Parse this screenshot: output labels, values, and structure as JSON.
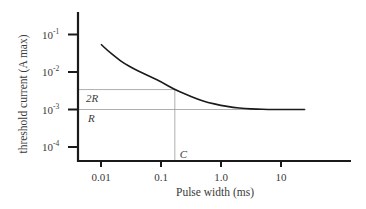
{
  "chart_data": {
    "type": "line",
    "title": "",
    "xlabel": "Pulse width (ms)",
    "ylabel": "threshold current  (A max)",
    "x_scale": "log",
    "y_scale": "log",
    "x_ticks": [
      {
        "value": 0.01,
        "label": "0.01"
      },
      {
        "value": 0.1,
        "label": "0.1"
      },
      {
        "value": 1.0,
        "label": "1.0"
      },
      {
        "value": 10,
        "label": "10"
      }
    ],
    "y_ticks": [
      {
        "value": 0.1,
        "label_base": "10",
        "label_exp": "-1"
      },
      {
        "value": 0.01,
        "label_base": "10",
        "label_exp": "-2"
      },
      {
        "value": 0.001,
        "label_base": "10",
        "label_exp": "-3"
      },
      {
        "value": 0.0001,
        "label_base": "10",
        "label_exp": "-4"
      }
    ],
    "xlim": [
      0.0042,
      300
    ],
    "ylim": [
      4e-05,
      0.8
    ],
    "grid": false,
    "legend": null,
    "series": [
      {
        "name": "strength-duration curve",
        "x": [
          0.01,
          0.013,
          0.018,
          0.025,
          0.035,
          0.05,
          0.07,
          0.1,
          0.17,
          0.25,
          0.4,
          0.6,
          1.0,
          1.6,
          2.5,
          4.0,
          6.0,
          10,
          16,
          25
        ],
        "y": [
          0.055,
          0.037,
          0.024,
          0.0165,
          0.0122,
          0.0093,
          0.0072,
          0.0055,
          0.0034,
          0.0026,
          0.0019,
          0.00155,
          0.00128,
          0.00114,
          0.00106,
          0.00102,
          0.001,
          0.001,
          0.001,
          0.001
        ]
      }
    ],
    "annotations": [
      {
        "type": "hline",
        "y": 0.0034,
        "label": "2R",
        "description": "twice rheobase"
      },
      {
        "type": "hline",
        "y": 0.001,
        "label": "R",
        "description": "rheobase"
      },
      {
        "type": "vline",
        "x": 0.17,
        "label": "C",
        "description": "chronaxie"
      }
    ]
  }
}
